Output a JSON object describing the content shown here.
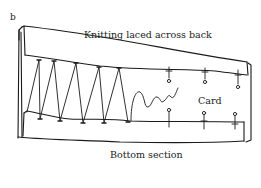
{
  "figure": {
    "panel_label": "b",
    "labels": {
      "top": "Knitting laced across back",
      "card": "Card",
      "bottom": "Bottom section"
    },
    "colors": {
      "ink": "#1a1a1a",
      "background": "#ffffff"
    },
    "elements": {
      "top_section": "folded top strip",
      "bottom_section": "folded bottom strip",
      "lacing": "zigzag lacing thread",
      "loose_thread": "wavy loose end",
      "pins_top": 3,
      "pins_bottom": 3
    }
  }
}
